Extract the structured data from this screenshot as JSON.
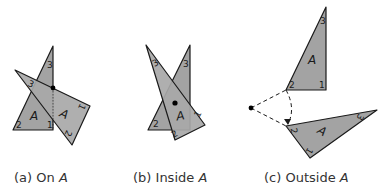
{
  "figure": {
    "panels": [
      {
        "id": "a",
        "caption_prefix": "(a)",
        "caption_text": "On",
        "caption_var": "A",
        "shape_label": "A",
        "vertex_labels_original": [
          "1",
          "2",
          "3"
        ],
        "vertex_labels_rotated": [
          "1",
          "2",
          "3"
        ],
        "center_position": "on the triangle (vertex/edge)"
      },
      {
        "id": "b",
        "caption_prefix": "(b)",
        "caption_text": "Inside",
        "caption_var": "A",
        "shape_label": "A",
        "vertex_labels_original": [
          "2",
          "3"
        ],
        "vertex_labels_rotated": [
          "1",
          "2",
          "3"
        ],
        "center_position": "inside the triangle"
      },
      {
        "id": "c",
        "caption_prefix": "(c)",
        "caption_text": "Outside",
        "caption_var": "A",
        "shape_label": "A",
        "vertex_labels_original": [
          "1",
          "2",
          "3"
        ],
        "vertex_labels_rotated": [
          "1",
          "2",
          "3"
        ],
        "center_position": "outside the triangle"
      }
    ],
    "colors": {
      "fill": "#a3a3a3",
      "stroke": "#1a1a1a",
      "background": "#ffffff"
    }
  }
}
